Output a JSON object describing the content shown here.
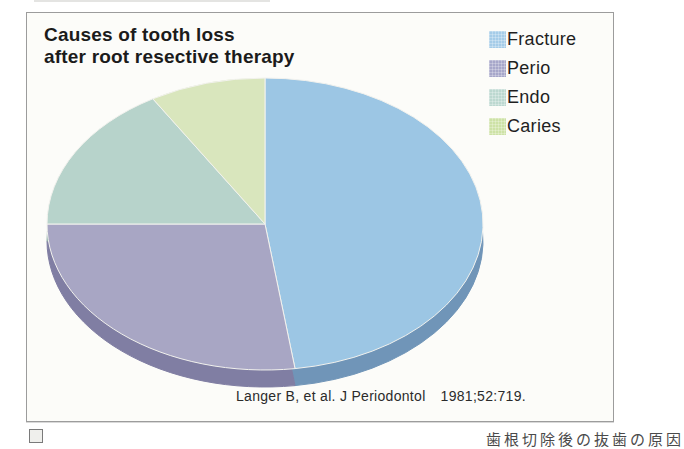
{
  "frame": {
    "border_color": "#9c9c9c",
    "background": "#fcfcf9"
  },
  "title": {
    "line1": "Causes of tooth loss",
    "line2": "after root resective therapy"
  },
  "legend": {
    "position": "top-right",
    "items": [
      {
        "label": "Fracture",
        "swatch_color": "#a5cce8",
        "swatch_style": "background-color:#a5cce8"
      },
      {
        "label": "Perio",
        "swatch_color": "#a7a7ca",
        "swatch_style": "background-color:#a7a7ca"
      },
      {
        "label": "Endo",
        "swatch_color": "#bcd8d0",
        "swatch_style": "background-color:#bcd8d0"
      },
      {
        "label": "Caries",
        "swatch_color": "#cde2a6",
        "swatch_style": "background-color:#cde2a6"
      }
    ]
  },
  "citation": {
    "source": "Langer B, et al. J Periodontol",
    "ref": "1981;52:719."
  },
  "caption_fragment": {
    "text": "歯根切除後の抜歯の原因"
  },
  "chart_data": {
    "type": "pie",
    "title": "Causes of tooth loss after root resective therapy",
    "categories": [
      "Fracture",
      "Perio",
      "Endo",
      "Caries"
    ],
    "values": [
      47.8,
      27.2,
      16.4,
      8.6
    ],
    "unit": "percent, estimated from slice angles (172°, 98°, 59°, 31°)",
    "colors": [
      "#9cc6e4",
      "#a8a6c4",
      "#b7d3cb",
      "#d9e6bd"
    ],
    "side_colors": [
      "#7095b8",
      "#807ea3",
      "#90aea7",
      "#b3c294"
    ],
    "start": "12 o'clock, clockwise",
    "legend_position": "top-right",
    "style": "3d-ellipse",
    "data_labels": false,
    "geometry": {
      "cx": 265,
      "cy": 224,
      "rx": 218,
      "ry": 146,
      "depth": 17
    }
  }
}
